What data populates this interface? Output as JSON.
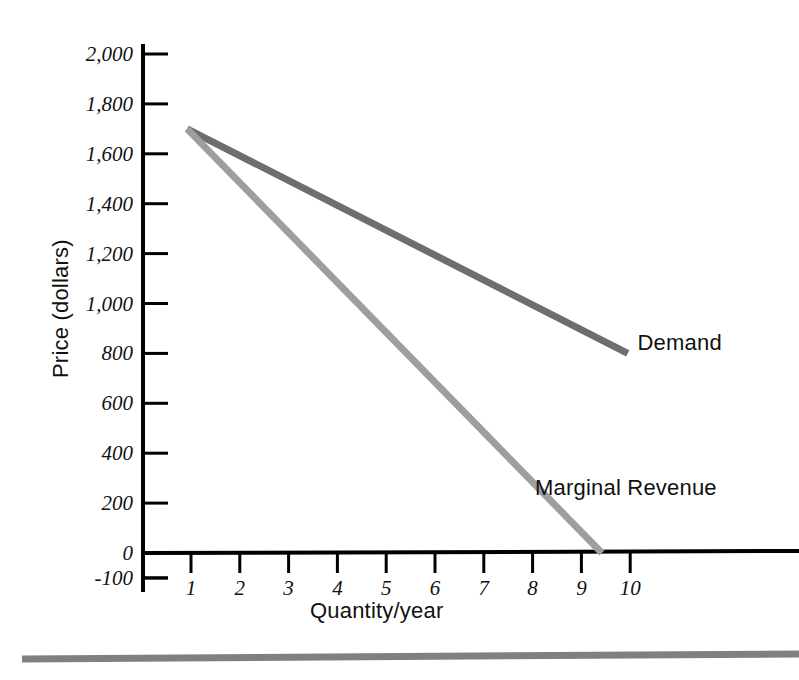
{
  "chart_data": {
    "type": "line",
    "title": "",
    "xlabel": "Quantity/year",
    "ylabel": "Price (dollars)",
    "xlim": [
      0,
      10.6
    ],
    "ylim": [
      -100,
      2000
    ],
    "grid": false,
    "legend_position": "inline-right-of-lines",
    "x_ticks": [
      "1",
      "2",
      "3",
      "4",
      "5",
      "6",
      "7",
      "8",
      "9",
      "10"
    ],
    "x_tick_values": [
      1,
      2,
      3,
      4,
      5,
      6,
      7,
      8,
      9,
      10
    ],
    "y_ticks": [
      "2,000",
      "1,800",
      "1,600",
      "1,400",
      "1,200",
      "1,000",
      "800",
      "600",
      "400",
      "200",
      "0",
      "-100"
    ],
    "y_tick_values": [
      2000,
      1800,
      1600,
      1400,
      1200,
      1000,
      800,
      600,
      400,
      200,
      0,
      -100
    ],
    "series": [
      {
        "name": "Demand",
        "color": "#6e6e6e",
        "label_x": 10.15,
        "label_y": 830,
        "points": [
          {
            "x": 0.92,
            "y": 1700
          },
          {
            "x": 9.95,
            "y": 800
          }
        ]
      },
      {
        "name": "Marginal Revenue",
        "color": "#9e9e9e",
        "label_x": 8.05,
        "label_y": 250,
        "points": [
          {
            "x": 0.92,
            "y": 1700
          },
          {
            "x": 9.42,
            "y": 0
          }
        ]
      }
    ],
    "axis_color": "#000000",
    "footer_rule_color": "#808080"
  }
}
